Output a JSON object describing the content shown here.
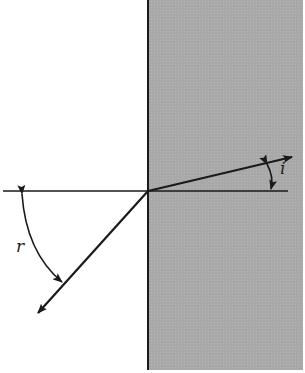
{
  "diagram": {
    "labels": {
      "reflection_angle": "r",
      "incidence_angle": "i"
    },
    "colors": {
      "medium_fill": "#a9a9a9",
      "line": "#1a1a1a",
      "background": "#ffffff"
    }
  }
}
